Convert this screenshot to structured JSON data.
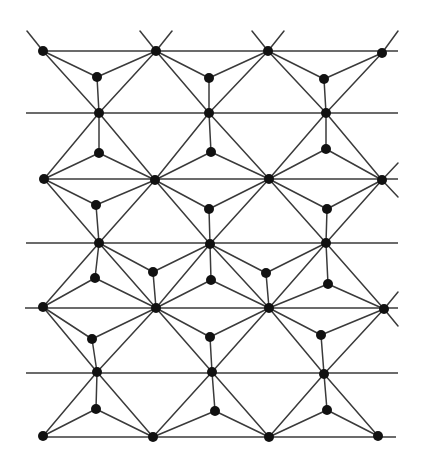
{
  "diagram": {
    "title": "",
    "width": 427,
    "height": 465,
    "colors": {
      "line": "#3a3a3a",
      "node": "#111111",
      "background": "#ffffff"
    },
    "node_radius": 5,
    "horizontal_lines": [
      {
        "y": 51,
        "x1": 43,
        "x2": 398
      },
      {
        "y": 113,
        "x1": 26,
        "x2": 398
      },
      {
        "y": 179,
        "x1": 43,
        "x2": 398
      },
      {
        "y": 243,
        "x1": 26,
        "x2": 398
      },
      {
        "y": 308,
        "x1": 25,
        "x2": 398
      },
      {
        "y": 373,
        "x1": 26,
        "x2": 398
      },
      {
        "y": 437,
        "x1": 43,
        "x2": 396
      }
    ],
    "nodes": {
      "A1": [
        43,
        51
      ],
      "A2": [
        156,
        51
      ],
      "A3": [
        268,
        51
      ],
      "A4": [
        382,
        53
      ],
      "B1": [
        99,
        113
      ],
      "B2": [
        209,
        113
      ],
      "B3": [
        326,
        113
      ],
      "C1": [
        44,
        179
      ],
      "C2": [
        155,
        180
      ],
      "C3": [
        269,
        179
      ],
      "C4": [
        382,
        180
      ],
      "D1": [
        99,
        243
      ],
      "D2": [
        210,
        244
      ],
      "D3": [
        326,
        243
      ],
      "E1": [
        43,
        307
      ],
      "E2": [
        156,
        308
      ],
      "E3": [
        269,
        308
      ],
      "E4": [
        384,
        309
      ],
      "F1": [
        97,
        372
      ],
      "F2": [
        212,
        372
      ],
      "F3": [
        324,
        374
      ],
      "G1": [
        43,
        436
      ],
      "G2": [
        153,
        437
      ],
      "G3": [
        269,
        437
      ],
      "G4": [
        378,
        436
      ],
      "kAB1": [
        97,
        77
      ],
      "kAB2": [
        209,
        78
      ],
      "kAB3": [
        324,
        79
      ],
      "kBC1": [
        99,
        153
      ],
      "kBC2": [
        211,
        152
      ],
      "kBC3": [
        326,
        149
      ],
      "kCD1": [
        96,
        205
      ],
      "kCD2": [
        209,
        209
      ],
      "kCD3": [
        327,
        209
      ],
      "kDE1": [
        95,
        278
      ],
      "kDE2": [
        211,
        280
      ],
      "kDE3": [
        328,
        284
      ],
      "kDEx1": [
        153,
        272
      ],
      "kDEx2": [
        266,
        273
      ],
      "kEF1": [
        92,
        339
      ],
      "kEF2": [
        210,
        337
      ],
      "kEF3": [
        321,
        335
      ],
      "kFG1": [
        96,
        409
      ],
      "kFG2": [
        215,
        411
      ],
      "kFG3": [
        327,
        410
      ]
    },
    "edges": [
      [
        "A1",
        "B1"
      ],
      [
        "A2",
        "B1"
      ],
      [
        "A2",
        "B2"
      ],
      [
        "A3",
        "B2"
      ],
      [
        "A3",
        "B3"
      ],
      [
        "A4",
        "B3"
      ],
      [
        "A1",
        "kAB1"
      ],
      [
        "A2",
        "kAB1"
      ],
      [
        "kAB1",
        "B1"
      ],
      [
        "A2",
        "kAB2"
      ],
      [
        "A3",
        "kAB2"
      ],
      [
        "kAB2",
        "B2"
      ],
      [
        "A3",
        "kAB3"
      ],
      [
        "A4",
        "kAB3"
      ],
      [
        "kAB3",
        "B3"
      ],
      [
        "B1",
        "C1"
      ],
      [
        "B1",
        "C2"
      ],
      [
        "B2",
        "C2"
      ],
      [
        "B2",
        "C3"
      ],
      [
        "B3",
        "C3"
      ],
      [
        "B3",
        "C4"
      ],
      [
        "C1",
        "kBC1"
      ],
      [
        "C2",
        "kBC1"
      ],
      [
        "kBC1",
        "B1"
      ],
      [
        "C2",
        "kBC2"
      ],
      [
        "C3",
        "kBC2"
      ],
      [
        "kBC2",
        "B2"
      ],
      [
        "C3",
        "kBC3"
      ],
      [
        "C4",
        "kBC3"
      ],
      [
        "kBC3",
        "B3"
      ],
      [
        "C1",
        "D1"
      ],
      [
        "C2",
        "D1"
      ],
      [
        "C2",
        "D2"
      ],
      [
        "C3",
        "D2"
      ],
      [
        "C3",
        "D3"
      ],
      [
        "C4",
        "D3"
      ],
      [
        "C1",
        "kCD1"
      ],
      [
        "C2",
        "kCD1"
      ],
      [
        "kCD1",
        "D1"
      ],
      [
        "C2",
        "kCD2"
      ],
      [
        "C3",
        "kCD2"
      ],
      [
        "kCD2",
        "D2"
      ],
      [
        "C3",
        "kCD3"
      ],
      [
        "C4",
        "kCD3"
      ],
      [
        "kCD3",
        "D3"
      ],
      [
        "D1",
        "E1"
      ],
      [
        "D1",
        "E2"
      ],
      [
        "D2",
        "E2"
      ],
      [
        "D2",
        "E3"
      ],
      [
        "D3",
        "E3"
      ],
      [
        "D3",
        "E4"
      ],
      [
        "E1",
        "kDE1"
      ],
      [
        "E2",
        "kDE1"
      ],
      [
        "kDE1",
        "D1"
      ],
      [
        "E2",
        "kDE2"
      ],
      [
        "E3",
        "kDE2"
      ],
      [
        "kDE2",
        "D2"
      ],
      [
        "E3",
        "kDE3"
      ],
      [
        "E4",
        "kDE3"
      ],
      [
        "kDE3",
        "D3"
      ],
      [
        "D1",
        "kDEx1"
      ],
      [
        "D2",
        "kDEx1"
      ],
      [
        "kDEx1",
        "E2"
      ],
      [
        "D2",
        "kDEx2"
      ],
      [
        "D3",
        "kDEx2"
      ],
      [
        "kDEx2",
        "E3"
      ],
      [
        "E1",
        "F1"
      ],
      [
        "E2",
        "F1"
      ],
      [
        "E2",
        "F2"
      ],
      [
        "E3",
        "F2"
      ],
      [
        "E3",
        "F3"
      ],
      [
        "E4",
        "F3"
      ],
      [
        "E1",
        "kEF1"
      ],
      [
        "E2",
        "kEF1"
      ],
      [
        "kEF1",
        "F1"
      ],
      [
        "E2",
        "kEF2"
      ],
      [
        "E3",
        "kEF2"
      ],
      [
        "kEF2",
        "F2"
      ],
      [
        "E3",
        "kEF3"
      ],
      [
        "E4",
        "kEF3"
      ],
      [
        "kEF3",
        "F3"
      ],
      [
        "F1",
        "G1"
      ],
      [
        "F1",
        "G2"
      ],
      [
        "F2",
        "G2"
      ],
      [
        "F2",
        "G3"
      ],
      [
        "F3",
        "G3"
      ],
      [
        "F3",
        "G4"
      ],
      [
        "G1",
        "kFG1"
      ],
      [
        "G2",
        "kFG1"
      ],
      [
        "kFG1",
        "F1"
      ],
      [
        "G2",
        "kFG2"
      ],
      [
        "G3",
        "kFG2"
      ],
      [
        "kFG2",
        "F2"
      ],
      [
        "G3",
        "kFG3"
      ],
      [
        "G4",
        "kFG3"
      ],
      [
        "kFG3",
        "F3"
      ]
    ],
    "stubs": [
      [
        43,
        51,
        27,
        31
      ],
      [
        156,
        51,
        140,
        31
      ],
      [
        156,
        51,
        172,
        31
      ],
      [
        268,
        51,
        252,
        31
      ],
      [
        268,
        51,
        284,
        31
      ],
      [
        382,
        53,
        398,
        31
      ],
      [
        382,
        180,
        398,
        163
      ],
      [
        382,
        180,
        398,
        197
      ],
      [
        384,
        309,
        398,
        292
      ],
      [
        384,
        309,
        398,
        326
      ]
    ]
  }
}
